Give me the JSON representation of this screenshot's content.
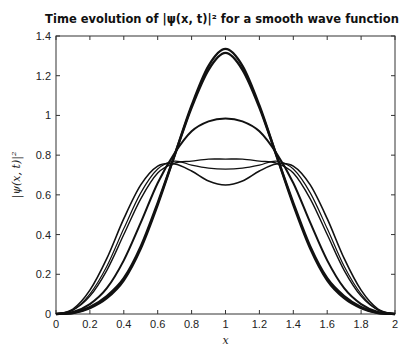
{
  "chart_data": {
    "type": "line",
    "title": "Time evolution of |ψ(x, t)|² for a smooth wave function",
    "xlabel": "x",
    "ylabel": "|ψ(x, t)|²",
    "xlim": [
      0,
      2
    ],
    "ylim": [
      0,
      1.4
    ],
    "xticks": [
      "0",
      "0.2",
      "0.4",
      "0.6",
      "0.8",
      "1",
      "1.2",
      "1.4",
      "1.6",
      "1.8",
      "2"
    ],
    "yticks": [
      "0",
      "0.2",
      "0.4",
      "0.6",
      "0.8",
      "1",
      "1.2",
      "1.4"
    ],
    "grid": false,
    "legend": null,
    "x": [
      0,
      0.1,
      0.2,
      0.3,
      0.4,
      0.5,
      0.6,
      0.7,
      0.8,
      0.9,
      1.0,
      1.1,
      1.2,
      1.3,
      1.4,
      1.5,
      1.6,
      1.7,
      1.8,
      1.9,
      2.0
    ],
    "series": [
      {
        "name": "t0",
        "width": 2.4,
        "values": [
          0,
          0.005,
          0.03,
          0.08,
          0.17,
          0.33,
          0.55,
          0.8,
          1.05,
          1.25,
          1.335,
          1.25,
          1.05,
          0.8,
          0.55,
          0.33,
          0.17,
          0.08,
          0.03,
          0.005,
          0
        ]
      },
      {
        "name": "t1",
        "width": 2.4,
        "values": [
          0,
          0.006,
          0.035,
          0.09,
          0.18,
          0.34,
          0.56,
          0.8,
          1.04,
          1.23,
          1.315,
          1.23,
          1.04,
          0.8,
          0.56,
          0.34,
          0.18,
          0.09,
          0.035,
          0.006,
          0
        ]
      },
      {
        "name": "t2",
        "width": 2.0,
        "values": [
          0,
          0.01,
          0.05,
          0.13,
          0.27,
          0.46,
          0.66,
          0.81,
          0.92,
          0.97,
          0.985,
          0.97,
          0.92,
          0.81,
          0.66,
          0.46,
          0.27,
          0.13,
          0.05,
          0.01,
          0
        ]
      },
      {
        "name": "t3",
        "width": 1.4,
        "values": [
          0,
          0.02,
          0.09,
          0.22,
          0.4,
          0.58,
          0.71,
          0.76,
          0.77,
          0.78,
          0.78,
          0.78,
          0.77,
          0.76,
          0.71,
          0.58,
          0.4,
          0.22,
          0.09,
          0.02,
          0
        ]
      },
      {
        "name": "t4",
        "width": 1.2,
        "values": [
          0,
          0.02,
          0.1,
          0.24,
          0.43,
          0.61,
          0.73,
          0.77,
          0.75,
          0.735,
          0.73,
          0.735,
          0.75,
          0.77,
          0.73,
          0.61,
          0.43,
          0.24,
          0.1,
          0.02,
          0
        ]
      },
      {
        "name": "t5",
        "width": 1.6,
        "values": [
          0,
          0.025,
          0.12,
          0.28,
          0.48,
          0.65,
          0.745,
          0.755,
          0.72,
          0.67,
          0.65,
          0.67,
          0.72,
          0.755,
          0.745,
          0.65,
          0.48,
          0.28,
          0.12,
          0.025,
          0
        ]
      }
    ]
  }
}
